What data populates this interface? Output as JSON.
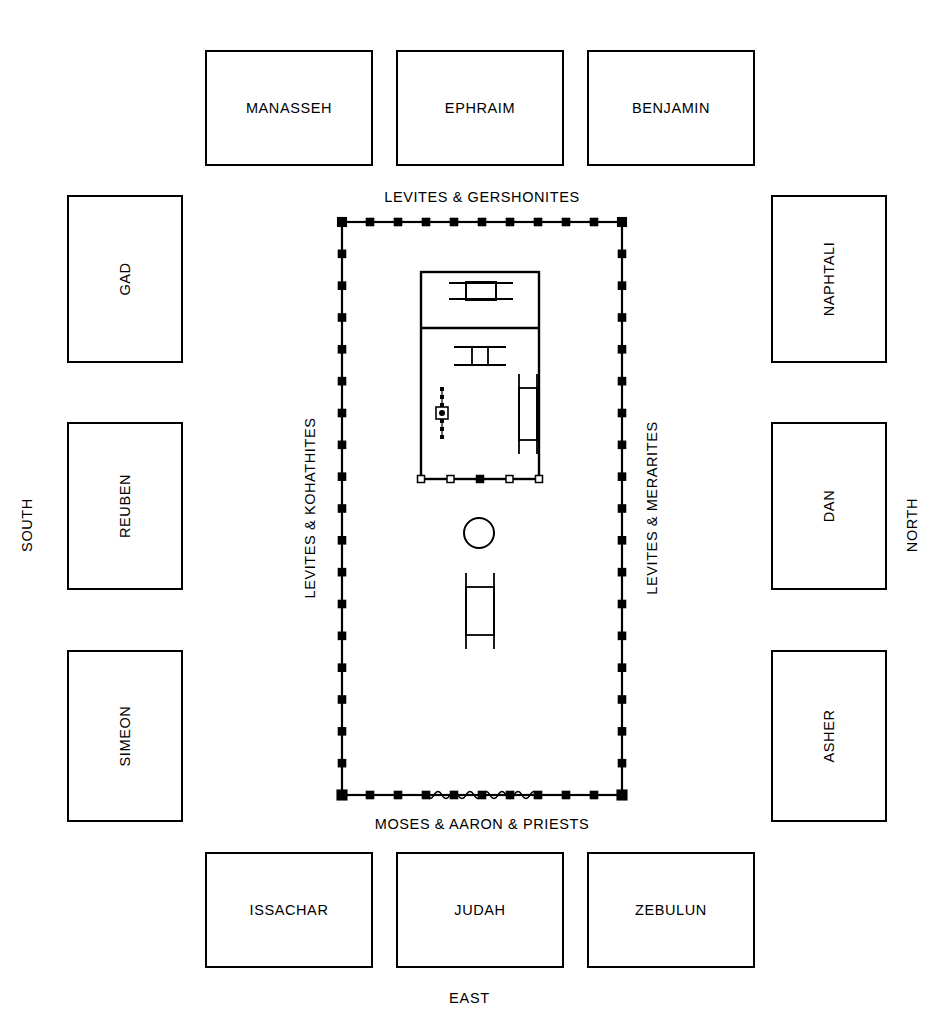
{
  "diagram": {
    "colors": {
      "line": "#000000",
      "background": "#ffffff"
    }
  },
  "directions": {
    "west_top": "",
    "south_left": "SOUTH",
    "north_right": "NORTH",
    "east_bottom": "EAST"
  },
  "levite_labels": {
    "top": "LEVITES & GERSHONITES",
    "left": "LEVITES & KOHATHITES",
    "right": "LEVITES & MERARITES",
    "bottom": "MOSES & AARON & PRIESTS"
  },
  "tribes": {
    "top_row": [
      {
        "name": "MANASSEH",
        "x": 205,
        "y": 50,
        "w": 168,
        "h": 116
      },
      {
        "name": "EPHRAIM",
        "x": 396,
        "y": 50,
        "w": 168,
        "h": 116
      },
      {
        "name": "BENJAMIN",
        "x": 587,
        "y": 50,
        "w": 168,
        "h": 116
      }
    ],
    "left_column": [
      {
        "name": "GAD",
        "x": 67,
        "y": 195,
        "w": 116,
        "h": 168
      },
      {
        "name": "REUBEN",
        "x": 67,
        "y": 422,
        "w": 116,
        "h": 168
      },
      {
        "name": "SIMEON",
        "x": 67,
        "y": 650,
        "w": 116,
        "h": 172
      }
    ],
    "right_column": [
      {
        "name": "NAPHTALI",
        "x": 771,
        "y": 195,
        "w": 116,
        "h": 168
      },
      {
        "name": "DAN",
        "x": 771,
        "y": 422,
        "w": 116,
        "h": 168
      },
      {
        "name": "ASHER",
        "x": 771,
        "y": 650,
        "w": 116,
        "h": 172
      }
    ],
    "bottom_row": [
      {
        "name": "ISSACHAR",
        "x": 205,
        "y": 852,
        "w": 168,
        "h": 116
      },
      {
        "name": "JUDAH",
        "x": 396,
        "y": 852,
        "w": 168,
        "h": 116
      },
      {
        "name": "ZEBULUN",
        "x": 587,
        "y": 852,
        "w": 168,
        "h": 116
      }
    ]
  },
  "courtyard": {
    "x": 342,
    "y": 222,
    "w": 280,
    "h": 573,
    "post_count_horizontal": 10,
    "post_count_vertical": 18,
    "gate_side": "east",
    "gate_label": "curtain-gate"
  },
  "tabernacle": {
    "x": 421,
    "y": 272,
    "w": 118,
    "h": 207,
    "holy_of_holies_height": 56,
    "rooms": [
      "holy-of-holies",
      "holy-place"
    ],
    "furniture": [
      {
        "name": "ark-of-the-covenant",
        "x": 466,
        "y": 282,
        "w": 30,
        "h": 18
      },
      {
        "name": "altar-of-incense",
        "x": 472,
        "y": 347,
        "w": 16,
        "h": 18
      },
      {
        "name": "lampstand-menorah",
        "x": 437,
        "y": 388,
        "w": 10,
        "h": 50
      },
      {
        "name": "table-of-showbread",
        "x": 519,
        "y": 388,
        "w": 18,
        "h": 52
      }
    ]
  },
  "courtyard_furniture": [
    {
      "name": "laver",
      "cx": 479,
      "cy": 533,
      "r": 15
    },
    {
      "name": "altar-of-burnt-offering",
      "x": 466,
      "y": 587,
      "w": 28,
      "h": 48
    }
  ]
}
